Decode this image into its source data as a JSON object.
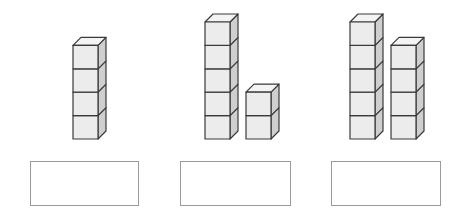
{
  "diagram": {
    "colors": {
      "front": "#ececec",
      "side": "#cfcfcf",
      "top": "#f4f4f4",
      "edge": "#3a3a3a",
      "box_border": "#9a9a9a"
    },
    "cube": {
      "width": 25,
      "height": 23.4,
      "depth_x": 8,
      "depth_y": 8
    },
    "base_y": 139,
    "groups": [
      {
        "name": "group-1",
        "total_cubes": 4,
        "stacks": [
          {
            "x": 73,
            "cubes": 4
          }
        ],
        "answer_box": {
          "x": 30,
          "y": 161,
          "width": 109,
          "height": 45,
          "value": ""
        }
      },
      {
        "name": "group-2",
        "total_cubes": 7,
        "stacks": [
          {
            "x": 205,
            "cubes": 5
          },
          {
            "x": 246,
            "cubes": 2
          }
        ],
        "answer_box": {
          "x": 180,
          "y": 161,
          "width": 111,
          "height": 45,
          "value": ""
        }
      },
      {
        "name": "group-3",
        "total_cubes": 9,
        "stacks": [
          {
            "x": 350,
            "cubes": 5
          },
          {
            "x": 391,
            "cubes": 4
          }
        ],
        "answer_box": {
          "x": 331,
          "y": 161,
          "width": 110,
          "height": 45,
          "value": ""
        }
      }
    ]
  }
}
